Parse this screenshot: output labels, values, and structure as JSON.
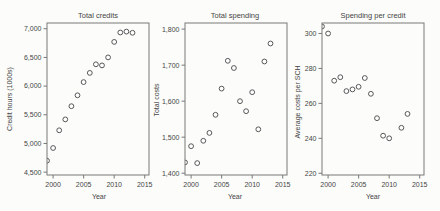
{
  "colors": {
    "background": "#fcfcfa",
    "axis": "#787878",
    "marker": "#575757",
    "text": "#454545"
  },
  "chart_data": [
    {
      "type": "scatter",
      "title": "Total credits",
      "xlabel": "Year",
      "ylabel": "Credit hours (1000s)",
      "marker": "open-circle",
      "grid": false,
      "xlim": [
        1999,
        2015.7
      ],
      "ylim": [
        4450,
        7100
      ],
      "xticks": [
        2000,
        2005,
        2010,
        2015
      ],
      "xtick_labels": [
        "2000",
        "2005",
        "2010",
        "2015"
      ],
      "yticks": [
        4500,
        5000,
        5500,
        6000,
        6500,
        7000
      ],
      "ytick_labels": [
        "4,500",
        "5,000",
        "5,500",
        "6,000",
        "6,500",
        "7,000"
      ],
      "x": [
        1999,
        2000,
        2001,
        2002,
        2003,
        2004,
        2005,
        2006,
        2007,
        2008,
        2009,
        2010,
        2011,
        2012,
        2013
      ],
      "y": [
        4700,
        4920,
        5230,
        5420,
        5650,
        5840,
        6070,
        6230,
        6380,
        6360,
        6500,
        6770,
        6935,
        6950,
        6930
      ]
    },
    {
      "type": "scatter",
      "title": "Total spending",
      "xlabel": "Year",
      "ylabel": "Total costs",
      "marker": "open-circle",
      "grid": false,
      "xlim": [
        1999,
        2015.7
      ],
      "ylim": [
        1395,
        1817
      ],
      "xticks": [
        2000,
        2005,
        2010,
        2015
      ],
      "xtick_labels": [
        "2000",
        "2005",
        "2010",
        "2015"
      ],
      "yticks": [
        1400,
        1500,
        1600,
        1700,
        1800
      ],
      "ytick_labels": [
        "1,400",
        "1,500",
        "1,600",
        "1,700",
        "1,800"
      ],
      "x": [
        1999,
        2000,
        2001,
        2002,
        2003,
        2004,
        2005,
        2006,
        2007,
        2008,
        2009,
        2010,
        2011,
        2012,
        2013
      ],
      "y": [
        1430,
        1475,
        1428,
        1490,
        1512,
        1562,
        1635,
        1712,
        1692,
        1600,
        1572,
        1625,
        1522,
        1710,
        1760
      ]
    },
    {
      "type": "scatter",
      "title": "Spending per credit",
      "xlabel": "Year",
      "ylabel": "Average costs per SCH",
      "marker": "open-circle",
      "grid": false,
      "xlim": [
        1999,
        2015.7
      ],
      "ylim": [
        219,
        306
      ],
      "xticks": [
        2000,
        2005,
        2010,
        2015
      ],
      "xtick_labels": [
        "2000",
        "2005",
        "2010",
        "2015"
      ],
      "yticks": [
        220,
        240,
        260,
        280,
        300
      ],
      "ytick_labels": [
        "220",
        "240",
        "260",
        "280",
        "300"
      ],
      "x": [
        1999,
        2000,
        2001,
        2002,
        2003,
        2004,
        2005,
        2006,
        2007,
        2008,
        2009,
        2010,
        2012,
        2013
      ],
      "y": [
        304,
        300,
        273,
        275,
        267,
        268,
        269.5,
        274.5,
        265.5,
        251.5,
        241.5,
        240,
        246,
        254
      ]
    }
  ]
}
